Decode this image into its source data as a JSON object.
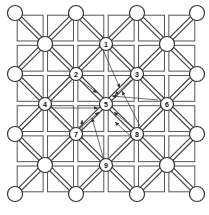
{
  "diagram": {
    "type": "board-game-grid",
    "colors": {
      "line": "#555555",
      "node_fill": "#ffffff",
      "node_stroke": "#333333",
      "text": "#111111"
    },
    "grid": {
      "origin": [
        15,
        13
      ],
      "extent": [
        197,
        194
      ],
      "cells": 3
    },
    "unlabeled_nodes": [
      [
        15,
        13
      ],
      [
        76,
        13
      ],
      [
        137,
        13
      ],
      [
        197,
        13
      ],
      [
        45,
        44
      ],
      [
        167,
        44
      ],
      [
        15,
        74
      ],
      [
        197,
        74
      ],
      [
        15,
        134
      ],
      [
        197,
        134
      ],
      [
        45,
        165
      ],
      [
        167,
        165
      ],
      [
        15,
        194
      ],
      [
        76,
        194
      ],
      [
        137,
        194
      ],
      [
        197,
        194
      ]
    ],
    "labeled_nodes": [
      {
        "label": "1",
        "x": 106,
        "y": 44
      },
      {
        "label": "2",
        "x": 76,
        "y": 74
      },
      {
        "label": "3",
        "x": 137,
        "y": 74
      },
      {
        "label": "4",
        "x": 45,
        "y": 104
      },
      {
        "label": "5",
        "x": 106,
        "y": 104
      },
      {
        "label": "6",
        "x": 167,
        "y": 104
      },
      {
        "label": "7",
        "x": 76,
        "y": 134
      },
      {
        "label": "8",
        "x": 137,
        "y": 134
      },
      {
        "label": "9",
        "x": 106,
        "y": 165
      }
    ],
    "arrows": [
      {
        "from": [
          103,
          50
        ],
        "to": [
          120,
          88
        ]
      },
      {
        "from": [
          80,
          80
        ],
        "to": [
          97,
          93
        ]
      },
      {
        "from": [
          50,
          108
        ],
        "to": [
          98,
          108
        ]
      },
      {
        "from": [
          131,
          80
        ],
        "to": [
          115,
          95
        ]
      },
      {
        "from": [
          158,
          100
        ],
        "to": [
          112,
          96
        ]
      },
      {
        "from": [
          80,
          128
        ],
        "to": [
          99,
          112
        ]
      },
      {
        "from": [
          132,
          127
        ],
        "to": [
          114,
          112
        ]
      },
      {
        "from": [
          104,
          160
        ],
        "to": [
          92,
          118
        ]
      },
      {
        "from": [
          140,
          126
        ],
        "to": [
          122,
          91
        ]
      },
      {
        "from": [
          82,
          140
        ],
        "to": [
          82,
          120
        ]
      },
      {
        "from": [
          133,
          138
        ],
        "to": [
          115,
          122
        ]
      }
    ]
  }
}
